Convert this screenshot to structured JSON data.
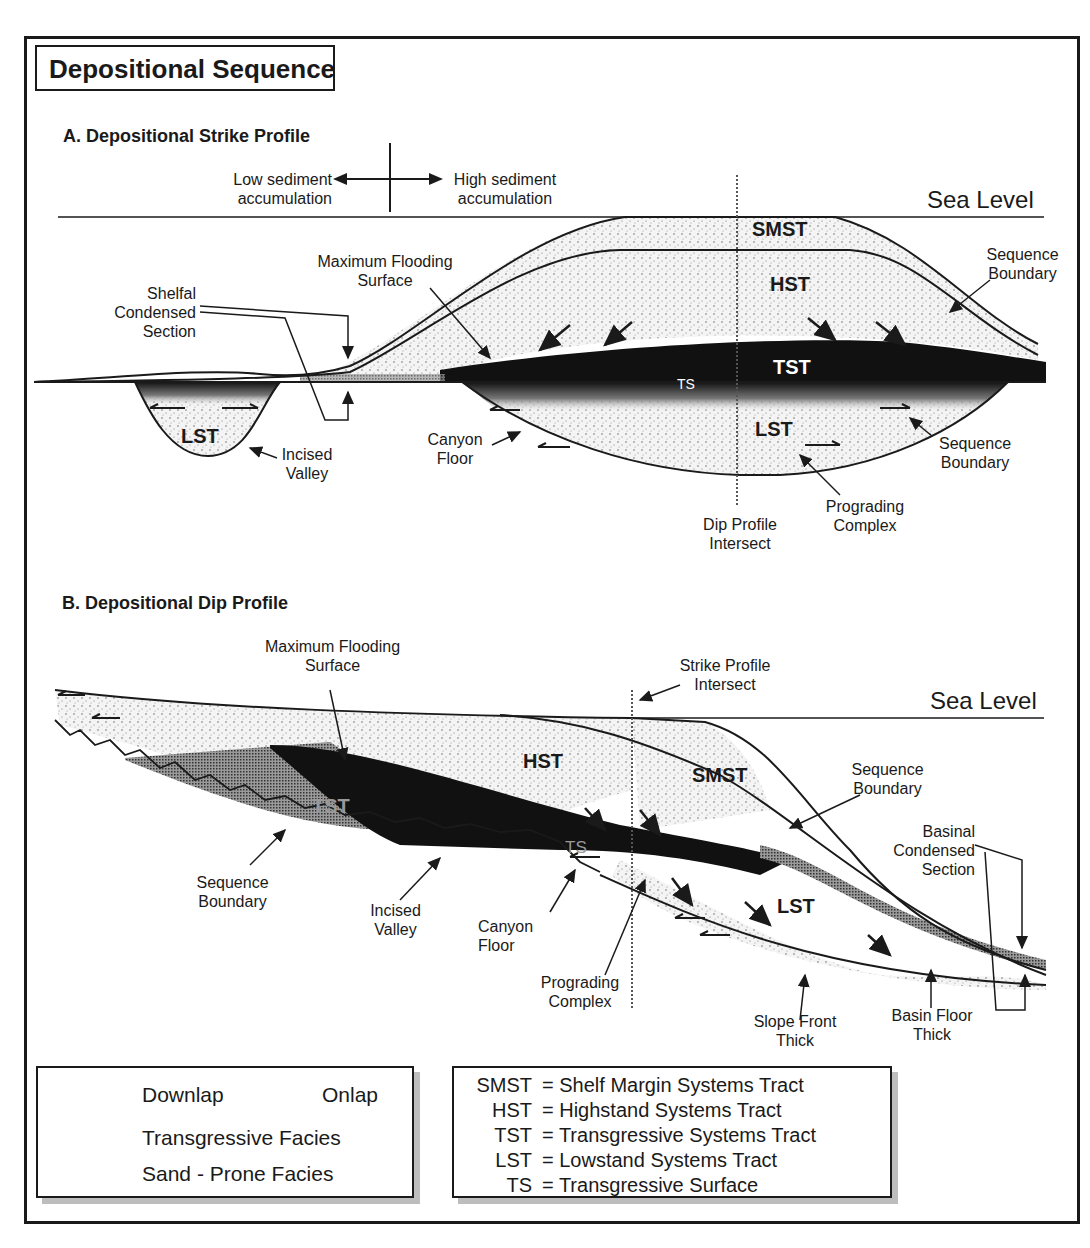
{
  "title": "Depositional Sequence",
  "section_a": {
    "heading": "A. Depositional Strike Profile",
    "axis_left": "Low sediment accumulation",
    "axis_left_lines": [
      "Low sediment",
      "accumulation"
    ],
    "axis_right_lines": [
      "High sediment",
      "accumulation"
    ],
    "sea_level": "Sea Level",
    "tracts": {
      "smst": "SMST",
      "hst": "HST",
      "tst": "TST",
      "ts": "TS",
      "lst_valley": "LST",
      "lst_canyon": "LST"
    },
    "labels": {
      "shelfal_condensed_section": [
        "Shelfal",
        "Condensed",
        "Section"
      ],
      "maximum_flooding_surface": [
        "Maximum Flooding",
        "Surface"
      ],
      "sequence_boundary_upper": [
        "Sequence",
        "Boundary"
      ],
      "incised_valley": [
        "Incised",
        "Valley"
      ],
      "canyon_floor": [
        "Canyon",
        "Floor"
      ],
      "sequence_boundary_lower": [
        "Sequence",
        "Boundary"
      ],
      "prograding_complex": [
        "Prograding",
        "Complex"
      ],
      "dip_profile_intersect": [
        "Dip Profile",
        "Intersect"
      ]
    }
  },
  "section_b": {
    "heading": "B. Depositional Dip Profile",
    "sea_level": "Sea Level",
    "tracts": {
      "hst": "HST",
      "smst": "SMST",
      "tst": "TST",
      "ts": "TS",
      "lst": "LST"
    },
    "labels": {
      "maximum_flooding_surface": [
        "Maximum Flooding",
        "Surface"
      ],
      "strike_profile_intersect": [
        "Strike Profile",
        "Intersect"
      ],
      "sequence_boundary_right": [
        "Sequence",
        "Boundary"
      ],
      "basinal_condensed_section": [
        "Basinal",
        "Condensed",
        "Section"
      ],
      "sequence_boundary_left": [
        "Sequence",
        "Boundary"
      ],
      "incised_valley": [
        "Incised",
        "Valley"
      ],
      "canyon_floor": [
        "Canyon",
        "Floor"
      ],
      "prograding_complex": [
        "Prograding",
        "Complex"
      ],
      "slope_front_thick": [
        "Slope Front",
        "Thick"
      ],
      "basin_floor_thick": [
        "Basin Floor",
        "Thick"
      ]
    }
  },
  "legend_symbols": {
    "downlap": "Downlap",
    "onlap": "Onlap",
    "transgressive_facies": "Transgressive Facies",
    "sand_prone_facies": "Sand - Prone Facies"
  },
  "legend_abbreviations": [
    {
      "abbr": "SMST",
      "meaning": "= Shelf Margin Systems Tract"
    },
    {
      "abbr": "HST",
      "meaning": "= Highstand Systems Tract"
    },
    {
      "abbr": "TST",
      "meaning": "= Transgressive Systems Tract"
    },
    {
      "abbr": "LST",
      "meaning": "= Lowstand Systems Tract"
    },
    {
      "abbr": "TS",
      "meaning": "= Transgressive Surface"
    }
  ],
  "colors": {
    "ink": "#1a1a1a",
    "sand": "#e9e9e9",
    "shadow": "#bdbdbd"
  }
}
